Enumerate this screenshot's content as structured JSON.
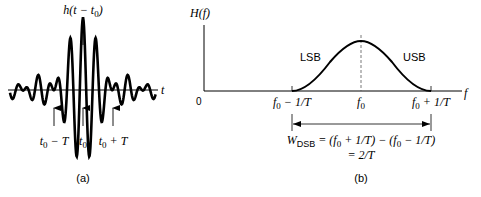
{
  "panel_a": {
    "caption": "(a)",
    "signal_label_h": "h",
    "signal_label_arg": "(t − t",
    "signal_label_sub": "0",
    "signal_label_close": ")",
    "axis_label": "t",
    "markers": [
      {
        "main": "t",
        "sub": "0",
        "rest": " − T"
      },
      {
        "main": "t",
        "sub": "0",
        "rest": ""
      },
      {
        "main": "t",
        "sub": "0",
        "rest": " + T"
      }
    ]
  },
  "panel_b": {
    "caption": "(b)",
    "y_label": "H(f)",
    "x_label": "f",
    "origin_label": "0",
    "lsb_label": "LSB",
    "usb_label": "USB",
    "ticks": [
      {
        "main": "f",
        "sub": "0",
        "rest": " − 1/T"
      },
      {
        "main": "f",
        "sub": "0",
        "rest": ""
      },
      {
        "main": "f",
        "sub": "0",
        "rest": " + 1/T"
      }
    ],
    "formula": {
      "lhs_main": "W",
      "lhs_sub": "DSB",
      "rhs_line1": " = (f",
      "rhs_line1_sub1": "0",
      "rhs_line1_mid": " + 1/T) − (f",
      "rhs_line1_sub2": "0",
      "rhs_line1_end": " − 1/T)",
      "rhs_line2": "= 2/T"
    }
  }
}
